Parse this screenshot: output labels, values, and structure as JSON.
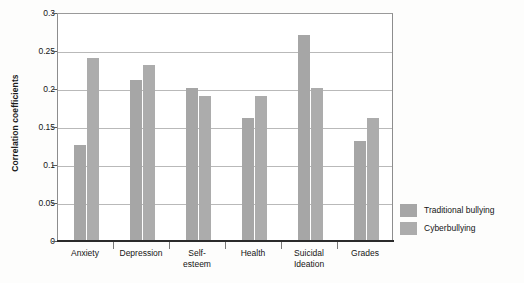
{
  "chart_data": {
    "type": "bar",
    "title": "",
    "xlabel": "",
    "ylabel": "Correlation coefficients",
    "ylim": [
      0,
      0.3
    ],
    "ytick_step": 0.05,
    "ytick_labels": [
      "0.3",
      "0.25",
      "0.2",
      "0.15",
      "0.1",
      "0.05",
      "0"
    ],
    "ytick_values": [
      0.3,
      0.25,
      0.2,
      0.15,
      0.1,
      0.05,
      0
    ],
    "grid": "horizontal",
    "legend_position": "right",
    "categories": [
      "Anxiety",
      "Depression",
      "Self-\nesteem",
      "Health",
      "Suicidal\nIdeation",
      "Grades"
    ],
    "category_labels": [
      {
        "line1": "Anxiety",
        "line2": ""
      },
      {
        "line1": "Depression",
        "line2": ""
      },
      {
        "line1": "Self-",
        "line2": "esteem"
      },
      {
        "line1": "Health",
        "line2": ""
      },
      {
        "line1": "Suicidal",
        "line2": "Ideation"
      },
      {
        "line1": "Grades",
        "line2": ""
      }
    ],
    "series": [
      {
        "name": "Traditional bullying",
        "color": "#a6a6a6",
        "values": [
          0.125,
          0.21,
          0.2,
          0.16,
          0.27,
          0.13
        ]
      },
      {
        "name": "Cyberbullying",
        "color": "#acacac",
        "values": [
          0.24,
          0.23,
          0.19,
          0.19,
          0.2,
          0.16
        ]
      }
    ]
  },
  "axis": {
    "y_title": "Correlation coefficients"
  },
  "legend": {
    "items": [
      {
        "label": "Traditional bullying",
        "color": "#a6a6a6"
      },
      {
        "label": "Cyberbullying",
        "color": "#acacac"
      }
    ]
  }
}
